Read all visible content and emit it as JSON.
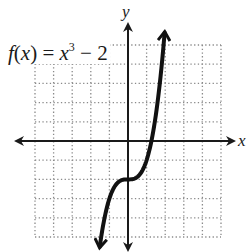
{
  "chart_data": {
    "type": "line",
    "function": "x^3 - 2",
    "xlabel": "x",
    "ylabel": "y",
    "xlim": [
      -5,
      5
    ],
    "ylim": [
      -5,
      5
    ],
    "grid": true,
    "grid_step": 1,
    "grid_style": "dotted",
    "legend": null,
    "series": [
      {
        "name": "f(x) = x³ − 2",
        "x": [
          -1.52,
          -1.4,
          -1.2,
          -1.0,
          -0.8,
          -0.6,
          -0.4,
          -0.2,
          0,
          0.2,
          0.4,
          0.6,
          0.8,
          1.0,
          1.2,
          1.4,
          1.6,
          1.8,
          1.97
        ],
        "y": [
          -5.5,
          -4.74,
          -3.73,
          -3.0,
          -2.51,
          -2.22,
          -2.06,
          -2.01,
          -2.0,
          -1.99,
          -1.94,
          -1.78,
          -1.49,
          -1.0,
          -0.27,
          0.74,
          2.1,
          3.83,
          5.65
        ],
        "arrows_at_ends": true
      }
    ],
    "annotations": [
      {
        "text": "f(x) = x³ − 2",
        "position": "upper-left"
      }
    ]
  },
  "labels": {
    "formula_f": "f",
    "formula_open": "(",
    "formula_x": "x",
    "formula_close": ") = ",
    "formula_base": "x",
    "formula_exp": "3",
    "formula_tail": " − 2",
    "x_axis": "x",
    "y_axis": "y"
  },
  "colors": {
    "curve": "#111111",
    "axis": "#1a1a1a",
    "grid": "#8a8a8a",
    "background": "#ffffff"
  }
}
